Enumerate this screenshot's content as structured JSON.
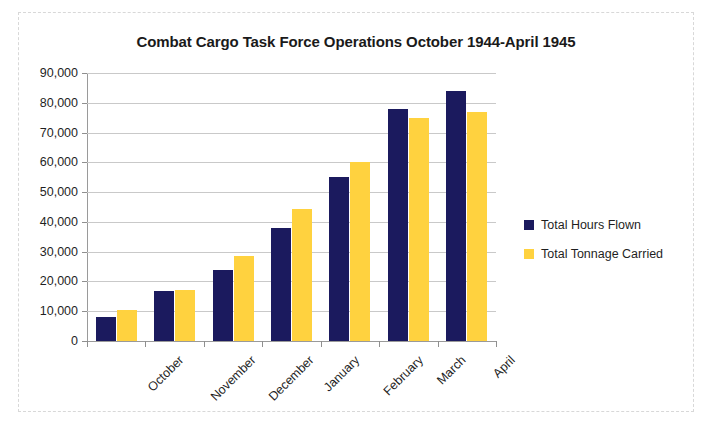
{
  "chart_data": {
    "type": "bar",
    "title": "Combat Cargo Task Force Operations October 1944-April 1945",
    "xlabel": "",
    "ylabel": "",
    "ylim": [
      0,
      90000
    ],
    "ytick_step": 10000,
    "ytick_labels": [
      "90,000",
      "80,000",
      "70,000",
      "60,000",
      "50,000",
      "40,000",
      "30,000",
      "20,000",
      "10,000",
      "0"
    ],
    "grid": true,
    "legend_position": "right",
    "categories": [
      "October",
      "November",
      "December",
      "January",
      "February",
      "March",
      "April"
    ],
    "series": [
      {
        "name": "Total Hours Flown",
        "color": "#1b1a5e",
        "values": [
          8000,
          16800,
          24000,
          38000,
          55000,
          78000,
          84000
        ]
      },
      {
        "name": "Total Tonnage Carried",
        "color": "#ffd23f",
        "values": [
          10500,
          17000,
          28500,
          44500,
          60000,
          74800,
          76800
        ]
      }
    ]
  }
}
